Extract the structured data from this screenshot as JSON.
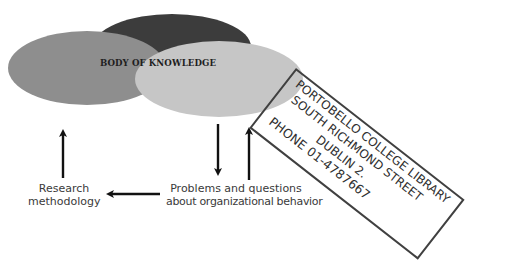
{
  "diagram": {
    "center_label": "BODY OF KNOWLEDGE",
    "nodes": [
      {
        "id": "research",
        "label_line1": "Research",
        "label_line2": "methodology"
      },
      {
        "id": "problems",
        "label_line1": "Problems and questions",
        "label_line2": "about organizational behavior"
      }
    ],
    "edges": [
      {
        "from": "research",
        "to": "body_of_knowledge",
        "direction": "up"
      },
      {
        "from": "body_of_knowledge",
        "to": "problems",
        "direction": "down"
      },
      {
        "from": "problems",
        "to": "body_of_knowledge",
        "direction": "up"
      },
      {
        "from": "problems",
        "to": "research",
        "direction": "left"
      }
    ],
    "ellipse_colors": {
      "dark": "#3c3c3c",
      "medium": "#8e8e8e",
      "light": "#c6c6c6"
    }
  },
  "stamp": {
    "line1": "PORTOBELLO COLLEGE LIBRARY",
    "line2": "SOUTH RICHMOND STREET",
    "line3": "DUBLIN 2.",
    "line4": "PHONE 01-4787667"
  }
}
